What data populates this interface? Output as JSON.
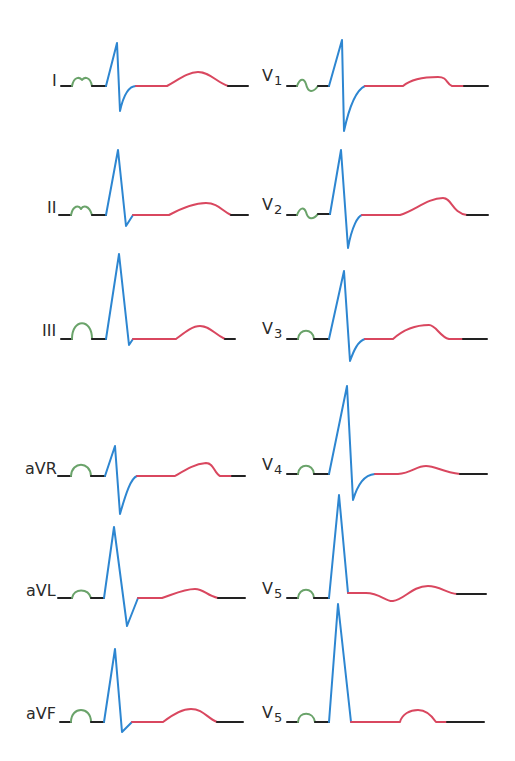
{
  "figure": {
    "colors": {
      "baseline": "#222222",
      "p_wave": "#6aa36a",
      "qrs_complex": "#2d86d1",
      "st_t_segment": "#d9475f",
      "background": "#ffffff"
    },
    "limb_leads": [
      {
        "id": "I",
        "label": "I",
        "sub": ""
      },
      {
        "id": "II",
        "label": "II",
        "sub": ""
      },
      {
        "id": "III",
        "label": "III",
        "sub": ""
      },
      {
        "id": "aVR",
        "label": "aVR",
        "sub": ""
      },
      {
        "id": "aVL",
        "label": "aVL",
        "sub": ""
      },
      {
        "id": "aVF",
        "label": "aVF",
        "sub": ""
      }
    ],
    "precordial_leads": [
      {
        "id": "V1",
        "label": "V",
        "sub": "1"
      },
      {
        "id": "V2",
        "label": "V",
        "sub": "2"
      },
      {
        "id": "V3",
        "label": "V",
        "sub": "3"
      },
      {
        "id": "V4",
        "label": "V",
        "sub": "4"
      },
      {
        "id": "V5",
        "label": "V",
        "sub": "5"
      },
      {
        "id": "V5b",
        "label": "V",
        "sub": "5"
      }
    ]
  }
}
